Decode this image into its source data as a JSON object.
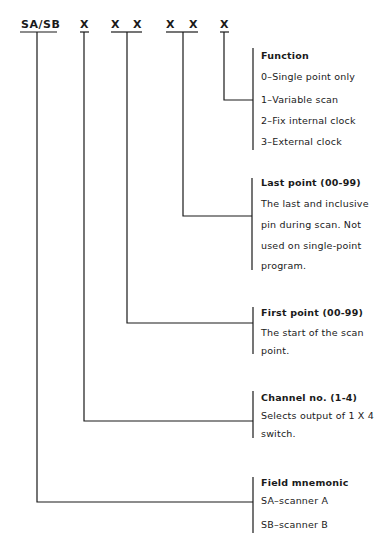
{
  "header": {
    "fields": [
      {
        "id": "mnemonic",
        "label": "SA/SB"
      },
      {
        "id": "channel",
        "label": "X"
      },
      {
        "id": "first_1",
        "label": "X"
      },
      {
        "id": "first_2",
        "label": "X"
      },
      {
        "id": "last_1",
        "label": "X"
      },
      {
        "id": "last_2",
        "label": "X"
      },
      {
        "id": "function",
        "label": "X"
      }
    ]
  },
  "blocks": {
    "function": {
      "title": "Function",
      "lines": [
        "0–Single point only",
        "1–Variable scan",
        "2–Fix internal clock",
        "3–External clock"
      ]
    },
    "last_point": {
      "title": "Last point (00-99)",
      "lines": [
        "The last and inclusive",
        "pin during scan.  Not",
        "used on single-point",
        "program."
      ]
    },
    "first_point": {
      "title": "First point (00-99)",
      "lines": [
        "The start of the scan",
        "point."
      ]
    },
    "channel": {
      "title": "Channel no. (1-4)",
      "lines": [
        "Selects output  of 1 X 4",
        "switch."
      ]
    },
    "field_mnemonic": {
      "title": "Field mnemonic",
      "lines": [
        "SA–scanner A",
        "SB–scanner B"
      ]
    }
  },
  "colors": {
    "ink": "#1a1a1a",
    "background": "#ffffff"
  }
}
